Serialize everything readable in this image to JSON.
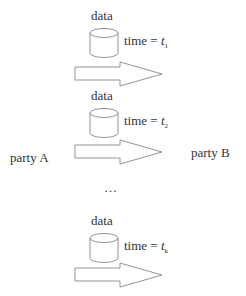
{
  "parties": {
    "sender": "party A",
    "receiver": "party B"
  },
  "transfers": [
    {
      "data_label": "data",
      "time_prefix": "time = ",
      "time_var": "t",
      "time_sub": "1"
    },
    {
      "data_label": "data",
      "time_prefix": "time = ",
      "time_var": "t",
      "time_sub": "2"
    },
    {
      "data_label": "data",
      "time_prefix": "time = ",
      "time_var": "t",
      "time_sub": "k"
    }
  ],
  "ellipsis": "…",
  "colors": {
    "stroke": "#888888",
    "text": "#333333"
  }
}
